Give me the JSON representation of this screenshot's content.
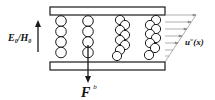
{
  "diagram": {
    "labels": {
      "field_base": "E",
      "field_sub": "0",
      "field_sep": "/",
      "field_base2": "H",
      "field_sub2": "0",
      "force_base": "F",
      "force_sup": "b",
      "velocity_base": "u",
      "velocity_sup": "w",
      "velocity_arg": "(x)"
    },
    "elements": {
      "plates": [
        "top-plate",
        "bottom-plate"
      ],
      "particle_chains": 4,
      "particles_per_chain": [
        4,
        4,
        8,
        8
      ],
      "field_arrow_direction": "up",
      "force_arrow_direction": "down",
      "velocity_profile": "linear-shear"
    },
    "colors": {
      "stroke": "#1a1a1a",
      "profile": "#8c8c8c",
      "background": "#ffffff"
    }
  }
}
